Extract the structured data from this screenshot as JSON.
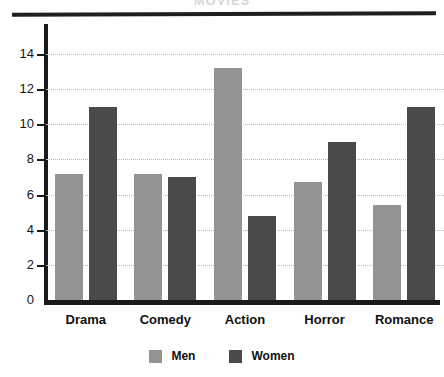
{
  "figure": {
    "title": "MOVIES",
    "background_color": "#ffffff"
  },
  "legend": {
    "position": "bottom-center",
    "entries": [
      {
        "label": "Men",
        "color": "#949494",
        "swatch_name": "legend-swatch-men"
      },
      {
        "label": "Women",
        "color": "#4a4a4a",
        "swatch_name": "legend-swatch-women"
      }
    ]
  },
  "axes": {
    "y_ticks": [
      "14",
      "12",
      "10",
      "8",
      "6",
      "4",
      "2",
      "0"
    ],
    "x_categories": [
      "Drama",
      "Comedy",
      "Action",
      "Horror",
      "Romance"
    ]
  },
  "chart_data": {
    "type": "bar",
    "title": "MOVIES",
    "xlabel": "",
    "ylabel": "",
    "ylim": [
      0,
      14
    ],
    "ytick_step": 2,
    "grid": true,
    "grid_style": "dotted",
    "legend_position": "bottom-center",
    "categories": [
      "Drama",
      "Comedy",
      "Action",
      "Horror",
      "Romance"
    ],
    "series": [
      {
        "name": "Men",
        "color": "#949494",
        "values": [
          7.2,
          7.2,
          13.2,
          6.7,
          5.4
        ]
      },
      {
        "name": "Women",
        "color": "#4a4a4a",
        "values": [
          11.0,
          7.0,
          4.8,
          9.0,
          11.0
        ]
      }
    ]
  }
}
